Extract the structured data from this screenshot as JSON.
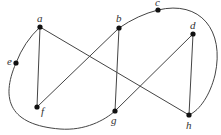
{
  "graph": {
    "vertices": [
      {
        "id": "a",
        "label": "a",
        "x": 40,
        "y": 27,
        "lx": 37,
        "ly": 22
      },
      {
        "id": "b",
        "label": "b",
        "x": 119,
        "y": 28,
        "lx": 116,
        "ly": 22
      },
      {
        "id": "c",
        "label": "c",
        "x": 158,
        "y": 10,
        "lx": 155,
        "ly": 6
      },
      {
        "id": "d",
        "label": "d",
        "x": 193,
        "y": 34,
        "lx": 190,
        "ly": 29
      },
      {
        "id": "e",
        "label": "e",
        "x": 16,
        "y": 63,
        "lx": 7,
        "ly": 65
      },
      {
        "id": "f",
        "label": "f",
        "x": 37,
        "y": 107,
        "lx": 41,
        "ly": 115
      },
      {
        "id": "g",
        "label": "g",
        "x": 115,
        "y": 111,
        "lx": 111,
        "ly": 124
      },
      {
        "id": "h",
        "label": "h",
        "x": 189,
        "y": 115,
        "lx": 186,
        "ly": 129
      }
    ],
    "edges": [
      {
        "from": "a",
        "to": "f"
      },
      {
        "from": "a",
        "to": "h"
      },
      {
        "from": "b",
        "to": "f"
      },
      {
        "from": "b",
        "to": "g"
      },
      {
        "from": "d",
        "to": "g"
      },
      {
        "from": "d",
        "to": "h"
      }
    ],
    "curved_edges": [
      {
        "from": "a",
        "to": "e",
        "path": "M40,27 Q24,42 16,63"
      },
      {
        "from": "e",
        "to": "g",
        "path": "M16,63 C0,100 10,125 60,129 C85,131 105,120 115,111"
      },
      {
        "from": "b",
        "to": "c",
        "path": "M119,28 Q138,15 158,10"
      },
      {
        "from": "c",
        "to": "h",
        "path": "M158,10 C200,0 225,30 215,75 C210,95 200,110 189,115"
      }
    ]
  }
}
